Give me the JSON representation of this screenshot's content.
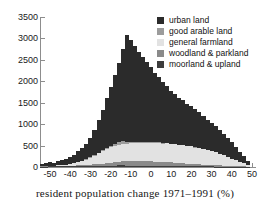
{
  "chart_data": {
    "type": "bar",
    "title": "",
    "subtitle": "",
    "xlabel": "resident population change 1971–1991 (%)",
    "ylabel": "",
    "xlim": [
      -55,
      52
    ],
    "ylim": [
      0,
      3500
    ],
    "grid": false,
    "stacked": true,
    "bin_width": 2,
    "legend_position": "top-right",
    "x_ticks": [
      -50,
      -40,
      -30,
      -20,
      -10,
      0,
      10,
      20,
      30,
      40,
      50
    ],
    "x_tick_labels": [
      "-50",
      "-40",
      "-30",
      "-20",
      "-10",
      "0",
      "10",
      "20",
      "30",
      "40",
      "50"
    ],
    "y_ticks": [
      0,
      500,
      1000,
      1500,
      2000,
      2500,
      3000,
      3500
    ],
    "y_tick_labels": [
      "0",
      "500",
      "1000",
      "1500",
      "2000",
      "2500",
      "3000",
      "3500"
    ],
    "x": [
      -54,
      -52,
      -50,
      -48,
      -46,
      -44,
      -42,
      -40,
      -38,
      -36,
      -34,
      -32,
      -30,
      -28,
      -26,
      -24,
      -22,
      -20,
      -18,
      -16,
      -14,
      -12,
      -10,
      -8,
      -6,
      -4,
      -2,
      0,
      2,
      4,
      6,
      8,
      10,
      12,
      14,
      16,
      18,
      20,
      22,
      24,
      26,
      28,
      30,
      32,
      34,
      36,
      38,
      40,
      42,
      44,
      46,
      48
    ],
    "series": [
      {
        "name": "moorland & upland",
        "color": "#3d3d3d",
        "values": [
          10,
          12,
          14,
          14,
          16,
          16,
          18,
          20,
          20,
          22,
          24,
          26,
          26,
          28,
          30,
          30,
          32,
          34,
          34,
          36,
          36,
          34,
          34,
          32,
          32,
          30,
          30,
          28,
          28,
          26,
          26,
          24,
          24,
          22,
          22,
          20,
          20,
          18,
          18,
          16,
          16,
          14,
          14,
          12,
          12,
          10,
          10,
          8,
          8,
          6,
          6,
          4
        ]
      },
      {
        "name": "woodland & parkland",
        "color": "#8a8a8a",
        "values": [
          4,
          5,
          6,
          7,
          8,
          9,
          10,
          12,
          14,
          16,
          20,
          24,
          30,
          36,
          44,
          52,
          60,
          70,
          80,
          88,
          96,
          100,
          104,
          106,
          108,
          108,
          106,
          104,
          100,
          96,
          92,
          88,
          84,
          78,
          74,
          68,
          62,
          58,
          52,
          48,
          42,
          38,
          34,
          30,
          26,
          22,
          18,
          16,
          14,
          12,
          10,
          8
        ]
      },
      {
        "name": "general farmland",
        "color": "#e2e2e2",
        "values": [
          6,
          8,
          10,
          14,
          18,
          24,
          30,
          40,
          55,
          72,
          95,
          125,
          160,
          200,
          245,
          290,
          330,
          360,
          385,
          400,
          405,
          410,
          415,
          420,
          430,
          425,
          435,
          440,
          430,
          445,
          430,
          440,
          420,
          430,
          410,
          420,
          400,
          405,
          385,
          380,
          355,
          345,
          320,
          300,
          270,
          240,
          205,
          170,
          135,
          100,
          70,
          40
        ]
      },
      {
        "name": "good arable land",
        "color": "#9c9c9c",
        "values": [
          0,
          0,
          0,
          0,
          0,
          0,
          0,
          0,
          2,
          3,
          4,
          6,
          8,
          10,
          14,
          18,
          24,
          30,
          40,
          55,
          75,
          40,
          30,
          26,
          22,
          20,
          18,
          18,
          16,
          16,
          14,
          14,
          12,
          12,
          10,
          10,
          10,
          8,
          8,
          8,
          6,
          6,
          6,
          5,
          4,
          4,
          3,
          3,
          2,
          2,
          2,
          1
        ]
      },
      {
        "name": "urban land",
        "color": "#2b2b2b",
        "values": [
          60,
          75,
          85,
          70,
          95,
          110,
          130,
          160,
          200,
          250,
          300,
          360,
          460,
          600,
          760,
          950,
          1160,
          1380,
          1620,
          1860,
          2140,
          2500,
          2390,
          2230,
          2090,
          1980,
          1860,
          1740,
          1630,
          1520,
          1420,
          1330,
          1230,
          1160,
          1090,
          1040,
          980,
          940,
          880,
          830,
          770,
          700,
          660,
          620,
          560,
          500,
          440,
          380,
          310,
          240,
          170,
          90
        ]
      }
    ]
  },
  "legend": {
    "items": [
      {
        "label": "urban land",
        "color": "#2b2b2b"
      },
      {
        "label": "good arable land",
        "color": "#9c9c9c"
      },
      {
        "label": "general farmland",
        "color": "#e2e2e2"
      },
      {
        "label": "woodland & parkland",
        "color": "#8a8a8a"
      },
      {
        "label": "moorland & upland",
        "color": "#3d3d3d"
      }
    ]
  },
  "caption": {
    "text": "resident population change 1971–1991 (%)"
  },
  "colors": {
    "axis": "#8d8d8d",
    "text": "#1a1a1a",
    "background": "#ffffff"
  }
}
